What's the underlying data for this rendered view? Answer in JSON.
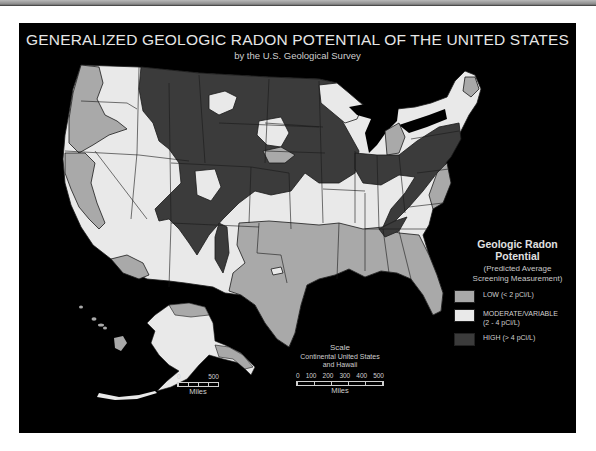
{
  "header": {
    "title": "GENERALIZED GEOLOGIC RADON POTENTIAL OF THE UNITED STATES",
    "subtitle": "by the U.S. Geological Survey"
  },
  "colors": {
    "background": "#000000",
    "low": "#a9a9a9",
    "moderate": "#e9e9e9",
    "high": "#3b3b3b",
    "border": "#1a1a1a"
  },
  "legend": {
    "title_line1": "Geologic Radon",
    "title_line2": "Potential",
    "subtitle_line1": "(Predicted Average",
    "subtitle_line2": "Screening Measurement)",
    "items": [
      {
        "key": "low",
        "label_line1": "LOW  (< 2 pCi/L)",
        "label_line2": "",
        "color": "#a9a9a9"
      },
      {
        "key": "moderate",
        "label_line1": "MODERATE/VARIABLE",
        "label_line2": "(2 - 4 pCi/L)",
        "color": "#e9e9e9"
      },
      {
        "key": "high",
        "label_line1": "HIGH  (> 4 pCi/L)",
        "label_line2": "",
        "color": "#3b3b3b"
      }
    ]
  },
  "scale_main": {
    "title": "Scale",
    "sub_line1": "Continental United States",
    "sub_line2": "and Hawaii",
    "ticks": [
      "0",
      "100",
      "200",
      "300",
      "400",
      "500"
    ],
    "unit": "Miles"
  },
  "scale_alaska": {
    "ticks": [
      "0",
      "500"
    ],
    "unit": "Miles"
  },
  "regions": {
    "conus": "Continental United States",
    "alaska": "Alaska",
    "hawaii": "Hawaii"
  }
}
